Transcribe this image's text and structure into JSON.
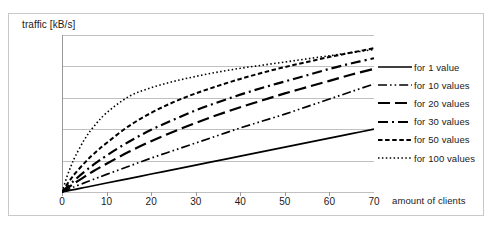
{
  "chart_data": {
    "type": "line",
    "title": "",
    "ylabel": "traffic [kB/s]",
    "xlabel": "amount of clients",
    "xlim": [
      0,
      70
    ],
    "ylim": [
      0,
      250
    ],
    "xticks": [
      0,
      10,
      20,
      30,
      40,
      50,
      60,
      70
    ],
    "yticks": [
      "0.0",
      "50.0",
      "100.0",
      "150.0",
      "200.0",
      "250.0"
    ],
    "ytick_values": [
      0,
      50,
      100,
      150,
      200,
      250
    ],
    "grid": "horizontal",
    "legend_position": "right",
    "line_color": "#000000",
    "x": [
      0,
      1,
      2,
      3,
      5,
      7,
      10,
      15,
      20,
      25,
      30,
      35,
      40,
      45,
      50,
      55,
      60,
      65,
      70
    ],
    "series": [
      {
        "name": "for 1 value",
        "label": "for 1 value",
        "dash": "solid",
        "dasharray": "",
        "width": 1.7,
        "values": [
          0,
          1.4,
          2.9,
          4.3,
          7.1,
          10,
          14.3,
          21.4,
          28.6,
          35.7,
          42.9,
          50,
          57.1,
          64.3,
          71.4,
          78.6,
          85.7,
          92.9,
          100
        ]
      },
      {
        "name": "for 10 values",
        "label": "for 10 values",
        "dash": "dash-dot-dot",
        "dasharray": "9 3 1.6 3 1.6 3",
        "width": 1.7,
        "values": [
          0,
          3,
          6,
          9,
          14.5,
          20,
          28,
          41,
          54,
          66,
          78,
          90,
          102,
          113,
          124,
          136,
          148,
          160,
          172
        ]
      },
      {
        "name": "for 20 values",
        "label": "for 20 values",
        "dash": "long-dash",
        "dasharray": "12 5",
        "width": 2.2,
        "values": [
          0,
          5,
          10,
          15,
          24,
          33,
          45,
          64,
          81,
          96,
          110,
          123,
          135,
          146,
          157,
          167,
          177,
          187,
          196
        ]
      },
      {
        "name": "for 30 values",
        "label": "for 30 values",
        "dash": "dash-dot",
        "dasharray": "10 4 2 4",
        "width": 2.2,
        "values": [
          0,
          7,
          13.5,
          20,
          32,
          43,
          58,
          80,
          99,
          115,
          130,
          143,
          155,
          166,
          176,
          186,
          196,
          205,
          213
        ]
      },
      {
        "name": "for 50 values",
        "label": "for 50 values",
        "dash": "short-dash",
        "dasharray": "4.5 2.6",
        "width": 2.0,
        "values": [
          0,
          11,
          21,
          30,
          46,
          60,
          78,
          105,
          126,
          143,
          157,
          169,
          180,
          190,
          199,
          207,
          215,
          222,
          229
        ]
      },
      {
        "name": "for 100 values",
        "label": "for 100 values",
        "dash": "dotted",
        "dasharray": "1.5 2.4",
        "width": 1.6,
        "values": [
          0,
          22,
          41,
          57,
          83,
          103,
          126,
          152,
          166,
          176,
          184,
          191,
          197,
          202,
          207,
          212,
          217,
          222,
          227
        ]
      }
    ]
  }
}
